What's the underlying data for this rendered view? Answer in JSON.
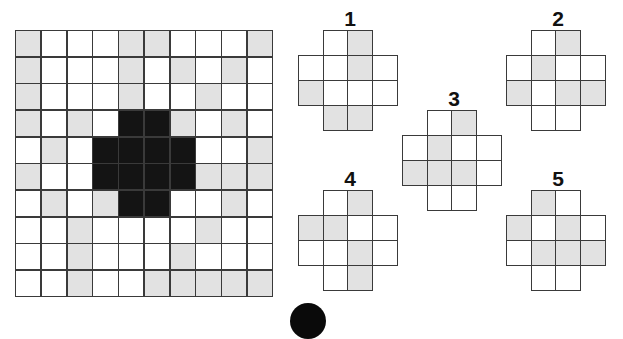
{
  "puzzle": {
    "main_grid": {
      "rows": 10,
      "cols": 10,
      "cells": [
        "GWWWGGWWWG",
        "GWWWGWGWGW",
        "GWWWGWWGWW",
        "GWGWBBGWGW",
        "WGWBBBBWWG",
        "GWWBBBBGGG",
        "WGWGBBWWGW",
        "WWGWWWWGWW",
        "WWGWWWGWWW",
        "WWGWWGGGGG"
      ]
    },
    "pieces": [
      {
        "label": "1",
        "cells": [
          "NWGN",
          "WWGW",
          "GWWW",
          "NGGN"
        ]
      },
      {
        "label": "2",
        "cells": [
          "NWGN",
          "WGWW",
          "GWGG",
          "NWWN"
        ]
      },
      {
        "label": "3",
        "cells": [
          "NWGN",
          "WGWW",
          "GGGW",
          "NWWN"
        ]
      },
      {
        "label": "4",
        "cells": [
          "NWGN",
          "GGWW",
          "WWGW",
          "NWGN"
        ]
      },
      {
        "label": "5",
        "cells": [
          "NGWN",
          "GWGW",
          "WGGG",
          "NWWN"
        ]
      }
    ],
    "legend": {
      "G": "gray",
      "W": "white",
      "B": "black",
      "N": "none"
    },
    "colors": {
      "gray": "#e2e2e2",
      "black": "#141414",
      "line": "#3a3a3a"
    }
  }
}
